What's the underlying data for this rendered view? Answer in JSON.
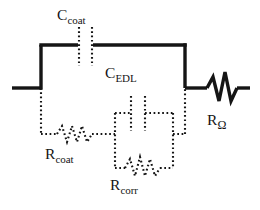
{
  "figure": {
    "kind": "electrical-equivalent-circuit-diagram",
    "background_color": "#ffffff",
    "line_color": "#151515",
    "solid_stroke_width": 3.2,
    "dotted_stroke_width": 2.0
  },
  "components": {
    "c_coat": {
      "id": "C-coat",
      "type": "capacitor",
      "label_base": "C",
      "label_sub": "coat",
      "label_text": "Ccoat",
      "style": "dotted",
      "orientation": "vertical-plates",
      "position": {
        "x": 83,
        "y": 24
      }
    },
    "c_edl": {
      "id": "C-EDL",
      "type": "capacitor",
      "label_base": "C",
      "label_sub": "EDL",
      "label_text": "CEDL",
      "style": "dotted",
      "orientation": "vertical-plates",
      "position": {
        "x": 108,
        "y": 66
      }
    },
    "r_coat": {
      "id": "R-coat",
      "type": "resistor",
      "label_base": "R",
      "label_sub": "coat",
      "label_text": "Rcoat",
      "style": "dotted",
      "orientation": "horizontal-zigzag",
      "position": {
        "x": 48,
        "y": 148
      }
    },
    "r_corr": {
      "id": "R-corr",
      "type": "resistor",
      "label_base": "R",
      "label_sub": "corr",
      "label_text": "Rcorr",
      "style": "dotted",
      "orientation": "horizontal-zigzag",
      "position": {
        "x": 112,
        "y": 178
      }
    },
    "r_omega": {
      "id": "R-omega",
      "type": "resistor",
      "label_base": "R",
      "label_sub": "Ω",
      "label_text": "RΩ",
      "style": "solid",
      "orientation": "horizontal-zigzag",
      "position": {
        "x": 209,
        "y": 113
      }
    }
  },
  "topology": {
    "description": "Series solution resistance R-omega joined to a parallel block of C-coat and (R-coat in series with the parallel pair C-EDL || R-corr).",
    "nodes": [
      "left-terminal",
      "node-A",
      "node-B",
      "right-terminal"
    ],
    "branches": [
      {
        "from": "node-A",
        "to": "node-B",
        "component": "C-coat",
        "path": "top"
      },
      {
        "from": "node-A",
        "to": "node-B",
        "component": "R-coat + (C-EDL || R-corr)",
        "path": "bottom"
      },
      {
        "from": "node-B",
        "to": "right-terminal",
        "component": "R-omega",
        "path": "series"
      }
    ]
  },
  "terminals": {
    "left": {
      "x": 12,
      "y": 88
    },
    "right": {
      "x": 250,
      "y": 88
    }
  }
}
